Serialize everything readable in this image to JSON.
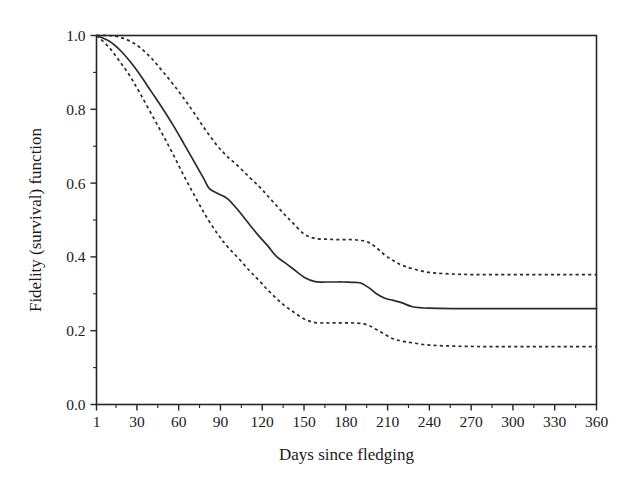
{
  "chart_data": {
    "type": "line",
    "title": "",
    "xlabel": "Days since fledging",
    "ylabel": "Fidelity (survival) function",
    "xlim": [
      1,
      360
    ],
    "ylim": [
      0.0,
      1.0
    ],
    "grid": false,
    "legend": "none",
    "x_ticks": [
      1,
      30,
      60,
      90,
      120,
      150,
      180,
      210,
      240,
      270,
      300,
      330,
      360
    ],
    "x_tick_labels": [
      "1",
      "30",
      "60",
      "90",
      "120",
      "150",
      "180",
      "210",
      "240",
      "270",
      "300",
      "330",
      "360"
    ],
    "x_minor_ticks": [
      15,
      45,
      75,
      105,
      135,
      165,
      195,
      225,
      255,
      285,
      315,
      345
    ],
    "y_ticks": [
      0.0,
      0.2,
      0.4,
      0.6,
      0.8,
      1.0
    ],
    "y_tick_labels": [
      "0.0",
      "0.2",
      "0.4",
      "0.6",
      "0.8",
      "1.0"
    ],
    "y_minor_ticks": [
      0.1,
      0.3,
      0.5,
      0.7,
      0.9
    ],
    "series": [
      {
        "name": "Fidelity (survival) estimate",
        "style": "solid",
        "x": [
          1,
          10,
          18,
          25,
          32,
          40,
          48,
          56,
          64,
          72,
          78,
          82,
          88,
          95,
          103,
          111,
          118,
          124,
          130,
          136,
          142,
          150,
          158,
          166,
          172,
          178,
          184,
          190,
          196,
          202,
          208,
          214,
          220,
          228,
          240,
          260,
          280,
          300,
          320,
          340,
          360
        ],
        "values": [
          1.0,
          0.985,
          0.96,
          0.93,
          0.895,
          0.85,
          0.805,
          0.757,
          0.705,
          0.652,
          0.612,
          0.585,
          0.572,
          0.558,
          0.525,
          0.487,
          0.455,
          0.43,
          0.402,
          0.385,
          0.368,
          0.345,
          0.333,
          0.332,
          0.332,
          0.332,
          0.331,
          0.33,
          0.318,
          0.3,
          0.288,
          0.282,
          0.276,
          0.265,
          0.261,
          0.26,
          0.26,
          0.26,
          0.26,
          0.26,
          0.26
        ]
      },
      {
        "name": "Upper 95% confidence limit",
        "style": "dashed",
        "x": [
          1,
          10,
          18,
          25,
          32,
          40,
          48,
          56,
          64,
          72,
          80,
          88,
          95,
          103,
          111,
          118,
          124,
          130,
          136,
          142,
          150,
          158,
          166,
          172,
          178,
          184,
          190,
          196,
          202,
          208,
          214,
          220,
          228,
          240,
          260,
          280,
          300,
          320,
          340,
          360
        ],
        "values": [
          1.0,
          1.0,
          0.995,
          0.985,
          0.968,
          0.94,
          0.905,
          0.868,
          0.828,
          0.785,
          0.74,
          0.7,
          0.672,
          0.645,
          0.615,
          0.59,
          0.565,
          0.54,
          0.515,
          0.492,
          0.462,
          0.45,
          0.448,
          0.447,
          0.447,
          0.447,
          0.445,
          0.44,
          0.425,
          0.405,
          0.39,
          0.378,
          0.368,
          0.358,
          0.353,
          0.352,
          0.352,
          0.352,
          0.352,
          0.352
        ]
      },
      {
        "name": "Lower 95% confidence limit",
        "style": "dashed",
        "x": [
          1,
          10,
          18,
          25,
          32,
          40,
          48,
          56,
          64,
          72,
          80,
          88,
          95,
          103,
          111,
          118,
          124,
          130,
          136,
          142,
          150,
          158,
          166,
          172,
          178,
          184,
          190,
          196,
          202,
          208,
          214,
          220,
          228,
          240,
          260,
          280,
          300,
          320,
          340,
          360
        ],
        "values": [
          1.0,
          0.968,
          0.928,
          0.89,
          0.845,
          0.79,
          0.735,
          0.678,
          0.618,
          0.562,
          0.508,
          0.462,
          0.428,
          0.396,
          0.362,
          0.335,
          0.31,
          0.288,
          0.268,
          0.252,
          0.232,
          0.222,
          0.221,
          0.221,
          0.221,
          0.221,
          0.22,
          0.215,
          0.203,
          0.19,
          0.178,
          0.172,
          0.167,
          0.161,
          0.158,
          0.157,
          0.157,
          0.157,
          0.157,
          0.157
        ]
      }
    ],
    "annotations": []
  },
  "figure": {
    "background_color": "#ffffff",
    "ink_color": "#262626"
  }
}
